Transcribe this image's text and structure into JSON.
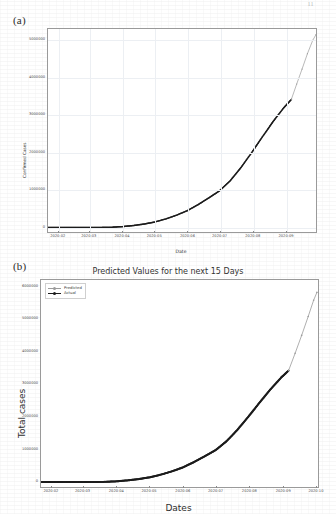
{
  "page": {
    "page_number": "11"
  },
  "panels": [
    {
      "tag": "(a)",
      "title": "",
      "xlabel": "Date",
      "ylabel": "Confirmed Cases",
      "legend": []
    },
    {
      "tag": "(b)",
      "title": "Predicted Values for the next 15 Days",
      "xlabel": "Dates",
      "ylabel": "Total cases",
      "legend": [
        "Predicted",
        "Actual"
      ]
    }
  ],
  "colors": {
    "actual": "#1c1c1c",
    "predicted": "#9b9b9b",
    "axis": "#9a9a9a",
    "grid": "#eceff3",
    "text": "#333333"
  },
  "chart_data": [
    {
      "type": "line",
      "title": "",
      "xlabel": "Date",
      "ylabel": "Confirmed Cases",
      "grid": true,
      "legend_position": "none",
      "xticklabels": [
        "2020-02",
        "2020-03",
        "2020-04",
        "2020-05",
        "2020-06",
        "2020-07",
        "2020-08",
        "2020-09",
        "2020-10"
      ],
      "yticklabels": [
        "0",
        "1000000",
        "2000000",
        "3000000",
        "4000000",
        "5000000"
      ],
      "ytickvalues": [
        0,
        1000000,
        2000000,
        3000000,
        4000000,
        5000000
      ],
      "ylim": [
        -120000,
        5300000
      ],
      "xlim": [
        "2020-01-22",
        "2020-09-28"
      ],
      "series": [
        {
          "name": "Actual",
          "color": "#1c1c1c",
          "x": [
            "2020-01-22",
            "2020-02-01",
            "2020-02-11",
            "2020-02-21",
            "2020-03-02",
            "2020-03-12",
            "2020-03-22",
            "2020-04-01",
            "2020-04-11",
            "2020-04-21",
            "2020-05-01",
            "2020-05-11",
            "2020-05-21",
            "2020-05-31",
            "2020-06-10",
            "2020-06-20",
            "2020-06-30",
            "2020-07-10",
            "2020-07-20",
            "2020-07-30",
            "2020-08-09",
            "2020-08-19",
            "2020-08-29",
            "2020-09-05"
          ],
          "values": [
            0,
            0,
            0,
            0,
            1000,
            3000,
            9000,
            25000,
            55000,
            95000,
            150000,
            230000,
            330000,
            450000,
            610000,
            790000,
            980000,
            1250000,
            1600000,
            2000000,
            2420000,
            2830000,
            3200000,
            3420000
          ]
        },
        {
          "name": "Predicted",
          "color": "#9b9b9b",
          "x": [
            "2020-09-05",
            "2020-09-10",
            "2020-09-15",
            "2020-09-20",
            "2020-09-25",
            "2020-09-28"
          ],
          "values": [
            3420000,
            3830000,
            4230000,
            4640000,
            5000000,
            5150000
          ]
        }
      ]
    },
    {
      "type": "line",
      "title": "Predicted Values for the next 15 Days",
      "xlabel": "Dates",
      "ylabel": "Total cases",
      "grid": false,
      "legend_position": "upper left",
      "xticklabels": [
        "2020-02",
        "2020-03",
        "2020-04",
        "2020-05",
        "2020-06",
        "2020-07",
        "2020-08",
        "2020-09",
        "2020-10"
      ],
      "yticklabels": [
        "0",
        "1000000",
        "2000000",
        "3000000",
        "4000000",
        "5000000",
        "6000000"
      ],
      "ytickvalues": [
        0,
        1000000,
        2000000,
        3000000,
        4000000,
        5000000,
        6000000
      ],
      "ylim": [
        -150000,
        6200000
      ],
      "xlim": [
        "2020-01-22",
        "2020-10-02"
      ],
      "series": [
        {
          "name": "Actual",
          "color": "#1c1c1c",
          "x": [
            "2020-01-22",
            "2020-02-01",
            "2020-02-11",
            "2020-02-21",
            "2020-03-02",
            "2020-03-12",
            "2020-03-22",
            "2020-04-01",
            "2020-04-11",
            "2020-04-21",
            "2020-05-01",
            "2020-05-11",
            "2020-05-21",
            "2020-05-31",
            "2020-06-10",
            "2020-06-20",
            "2020-06-30",
            "2020-07-10",
            "2020-07-20",
            "2020-07-30",
            "2020-08-09",
            "2020-08-19",
            "2020-08-29",
            "2020-09-05"
          ],
          "values": [
            0,
            0,
            0,
            0,
            1000,
            3000,
            9000,
            25000,
            55000,
            95000,
            150000,
            230000,
            330000,
            450000,
            610000,
            790000,
            980000,
            1250000,
            1600000,
            2000000,
            2420000,
            2830000,
            3200000,
            3420000
          ]
        },
        {
          "name": "Predicted",
          "color": "#9b9b9b",
          "x": [
            "2020-09-05",
            "2020-09-11",
            "2020-09-17",
            "2020-09-23",
            "2020-09-28",
            "2020-10-01"
          ],
          "values": [
            3420000,
            3950000,
            4500000,
            5080000,
            5580000,
            5820000
          ]
        }
      ]
    }
  ]
}
